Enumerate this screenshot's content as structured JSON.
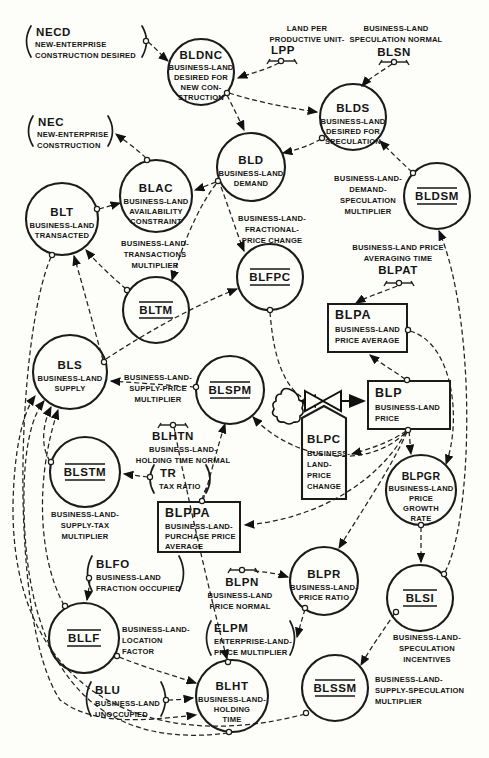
{
  "diagram": {
    "kind": "system-dynamics flow diagram",
    "sector": "business land",
    "nodes": {
      "necd": {
        "name": "NECD",
        "type": "external",
        "lines": [
          "NEW-ENTERPRISE",
          "CONSTRUCTION DESIRED"
        ]
      },
      "nec": {
        "name": "NEC",
        "type": "external",
        "lines": [
          "NEW-ENTERPRISE",
          "CONSTRUCTION"
        ]
      },
      "lpp": {
        "name": "LPP",
        "type": "constant",
        "lines": [
          "LAND PER",
          "PRODUCTIVE UNIT-"
        ]
      },
      "blsn": {
        "name": "BLSN",
        "type": "constant",
        "lines": [
          "BUSINESS-LAND",
          "SPECULATION NORMAL"
        ]
      },
      "bldnc": {
        "name": "BLDNC",
        "type": "auxiliary",
        "lines": [
          "BUSINESS-LAND",
          "DESIRED FOR",
          "NEW CON-",
          "STRUCTION"
        ]
      },
      "blds": {
        "name": "BLDS",
        "type": "auxiliary",
        "lines": [
          "BUSINESS-LAND",
          "DESIRED FOR",
          "SPECULATION"
        ]
      },
      "bld": {
        "name": "BLD",
        "type": "auxiliary",
        "lines": [
          "BUSINESS-LAND",
          "DEMAND"
        ]
      },
      "bldsm": {
        "name": "BLDSM",
        "type": "table-multiplier",
        "lines": [
          "BUSINESS-LAND-",
          "DEMAND-",
          "SPECULATION",
          "MULTIPLIER"
        ]
      },
      "blac": {
        "name": "BLAC",
        "type": "auxiliary",
        "lines": [
          "BUSINESS-LAND",
          "AVAILABILITY",
          "CONSTRAINT"
        ]
      },
      "blt": {
        "name": "BLT",
        "type": "auxiliary",
        "lines": [
          "BUSINESS-LAND",
          "TRANSACTED"
        ]
      },
      "bltm": {
        "name": "BLTM",
        "type": "table-multiplier",
        "lines": [
          "BUSINESS-LAND-",
          "TRANSACTIONS",
          "MULTIPLIER"
        ]
      },
      "blfpc": {
        "name": "BLFPC",
        "type": "table-multiplier",
        "lines": [
          "BUSINESS-LAND-",
          "FRACTIONAL-",
          "PRICE CHANGE"
        ]
      },
      "blpat": {
        "name": "BLPAT",
        "type": "constant",
        "lines": [
          "BUSINESS-LAND PRICE",
          "AVERAGING TIME"
        ]
      },
      "blpa": {
        "name": "BLPA",
        "type": "level",
        "lines": [
          "BUSINESS-LAND",
          "PRICE AVERAGE"
        ]
      },
      "bls": {
        "name": "BLS",
        "type": "auxiliary",
        "lines": [
          "BUSINESS-LAND",
          "SUPPLY"
        ]
      },
      "blspm": {
        "name": "BLSPM",
        "type": "table-multiplier",
        "lines": [
          "BUSINESS-LAND-",
          "SUPPLY-PRICE",
          "MULTIPLIER"
        ]
      },
      "blp": {
        "name": "BLP",
        "type": "level",
        "lines": [
          "BUSINESS-LAND",
          "PRICE"
        ]
      },
      "blpc": {
        "name": "BLPC",
        "type": "rate",
        "lines": [
          "BUSINESS-",
          "LAND-",
          "PRICE",
          "CHANGE"
        ]
      },
      "blhtn": {
        "name": "BLHTN",
        "type": "constant",
        "lines": [
          "BUSINESS-LAND-",
          "HOLDING TIME NORMAL"
        ]
      },
      "tr": {
        "name": "TR",
        "type": "external",
        "lines": [
          "TAX RATIO"
        ]
      },
      "blstm": {
        "name": "BLSTM",
        "type": "table-multiplier",
        "lines": [
          "BUSINESS-LAND-",
          "SUPPLY-TAX",
          "MULTIPLIER"
        ]
      },
      "blppa": {
        "name": "BLPPA",
        "type": "level",
        "lines": [
          "BUSINESS-LAND-",
          "PURCHASE PRICE",
          "AVERAGE"
        ]
      },
      "blpgr": {
        "name": "BLPGR",
        "type": "auxiliary",
        "lines": [
          "BUSINESS-LAND",
          "PRICE",
          "GROWTH",
          "RATE"
        ]
      },
      "blfo": {
        "name": "BLFO",
        "type": "external",
        "lines": [
          "BUSINESS-LAND",
          "FRACTION OCCUPIED"
        ]
      },
      "blpn": {
        "name": "BLPN",
        "type": "constant",
        "lines": [
          "BUSINESS-LAND",
          "PRICE NORMAL"
        ]
      },
      "blpr": {
        "name": "BLPR",
        "type": "auxiliary",
        "lines": [
          "BUSINESS-LAND-",
          "PRICE RATIO"
        ]
      },
      "blsi": {
        "name": "BLSI",
        "type": "table-multiplier",
        "lines": [
          "BUSINESS-LAND-",
          "SPECULATION",
          "INCENTIVES"
        ]
      },
      "elpm": {
        "name": "ELPM",
        "type": "external",
        "lines": [
          "ENTERPRISE-LAND-",
          "PRICE MULTIPLIER"
        ]
      },
      "bllf": {
        "name": "BLLF",
        "type": "table-multiplier",
        "lines": [
          "BUSINESS-LAND-",
          "LOCATION",
          "FACTOR"
        ]
      },
      "blu": {
        "name": "BLU",
        "type": "external",
        "lines": [
          "BUSINESS-LAND",
          "UNOCCUPIED"
        ]
      },
      "blht": {
        "name": "BLHT",
        "type": "auxiliary",
        "lines": [
          "BUSINESS-LAND-",
          "HOLDING",
          "TIME"
        ]
      },
      "blssm": {
        "name": "BLSSM",
        "type": "table-multiplier",
        "lines": [
          "BUSINESS-LAND-",
          "SUPPLY-SPECULATION",
          "MULTIPLIER"
        ]
      }
    },
    "links": [
      {
        "from": "NECD",
        "to": "BLDNC"
      },
      {
        "from": "LPP",
        "to": "BLDNC"
      },
      {
        "from": "BLSN",
        "to": "BLDS"
      },
      {
        "from": "BLDNC",
        "to": "BLD"
      },
      {
        "from": "BLDNC",
        "to": "BLDS"
      },
      {
        "from": "BLDS",
        "to": "BLD"
      },
      {
        "from": "BLDSM",
        "to": "BLDS"
      },
      {
        "from": "BLSI",
        "to": "BLDSM"
      },
      {
        "from": "BLD",
        "to": "BLAC"
      },
      {
        "from": "BLD",
        "to": "BLTM"
      },
      {
        "from": "BLD",
        "to": "BLFPC"
      },
      {
        "from": "BLAC",
        "to": "NEC"
      },
      {
        "from": "BLT",
        "to": "BLAC"
      },
      {
        "from": "BLTM",
        "to": "BLT"
      },
      {
        "from": "BLS",
        "to": "BLT"
      },
      {
        "from": "BLS",
        "to": "BLFPC"
      },
      {
        "from": "BLFPC",
        "to": "BLPC"
      },
      {
        "from": "BLPAT",
        "to": "BLPA"
      },
      {
        "from": "BLP",
        "to": "BLPA"
      },
      {
        "from": "BLPA",
        "to": "BLPGR"
      },
      {
        "from": "BLP",
        "to": "BLPGR"
      },
      {
        "from": "BLP",
        "to": "BLPR"
      },
      {
        "from": "BLP",
        "to": "BLPPA"
      },
      {
        "from": "BLP",
        "to": "BLSPM"
      },
      {
        "from": "BLP",
        "to": "BLPC"
      },
      {
        "from": "BLPC",
        "to": "BLP",
        "type": "flow"
      },
      {
        "from": "BLPGR",
        "to": "BLSI"
      },
      {
        "from": "BLSI",
        "to": "BLSSM"
      },
      {
        "from": "BLPPA",
        "to": "BLSPM"
      },
      {
        "from": "TR",
        "to": "BLSTM"
      },
      {
        "from": "BLPN",
        "to": "BLPR"
      },
      {
        "from": "BLPR",
        "to": "ELPM"
      },
      {
        "from": "BLFO",
        "to": "BLLF"
      },
      {
        "from": "BLU",
        "to": "BLHT"
      },
      {
        "from": "BLLF",
        "to": "BLHT"
      },
      {
        "from": "BLHTN",
        "to": "BLHT"
      },
      {
        "from": "BLSPM",
        "to": "BLS"
      },
      {
        "from": "BLSTM",
        "to": "BLS"
      },
      {
        "from": "BLLF",
        "to": "BLS"
      },
      {
        "from": "BLHT",
        "to": "BLS"
      },
      {
        "from": "BLSSM",
        "to": "BLS"
      },
      {
        "from": "BLT",
        "to": "BLHT"
      }
    ]
  }
}
